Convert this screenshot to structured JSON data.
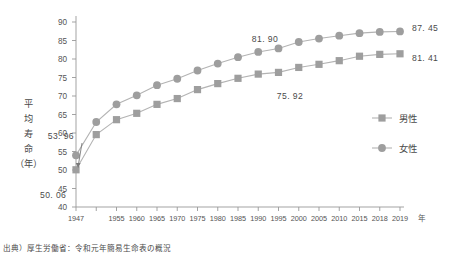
{
  "source_note": "出典）厚生労働省：令和元年簡易生命表の概況",
  "axis": {
    "y_title": "平均寿命（年）",
    "y_title_chars": [
      "平",
      "均",
      "寿",
      "命",
      "（年）"
    ],
    "x_unit": "年",
    "y_ticks": [
      40,
      45,
      50,
      55,
      60,
      65,
      70,
      75,
      80,
      85,
      90
    ],
    "x_tick_labels": [
      "1947",
      "",
      "1955",
      "1960",
      "1965",
      "1970",
      "1975",
      "1980",
      "1985",
      "1990",
      "1995",
      "2000",
      "2005",
      "2010",
      "2015",
      "2018",
      "2019"
    ]
  },
  "legend": {
    "items": [
      {
        "label": "男性",
        "marker": "square",
        "color": "#9e9e9e"
      },
      {
        "label": "女性",
        "marker": "circle",
        "color": "#9e9e9e"
      }
    ]
  },
  "annotations": [
    {
      "text": "53. 96",
      "series": "女性",
      "year": 1947
    },
    {
      "text": "50. 06",
      "series": "男性",
      "year": 1947
    },
    {
      "text": "81. 90",
      "series": "女性",
      "year": 1990
    },
    {
      "text": "75. 92",
      "series": "男性",
      "year": 1990
    },
    {
      "text": "87. 45",
      "series": "女性",
      "year": 2019
    },
    {
      "text": "81. 41",
      "series": "男性",
      "year": 2019
    }
  ],
  "chart_data": {
    "type": "line",
    "title": "",
    "xlabel": "年",
    "ylabel": "平均寿命（年）",
    "ylim": [
      40,
      90
    ],
    "xlim": [
      1947,
      2019
    ],
    "grid": false,
    "legend_position": "right",
    "x": [
      1947,
      1950,
      1955,
      1960,
      1965,
      1970,
      1975,
      1980,
      1985,
      1990,
      1995,
      2000,
      2005,
      2010,
      2015,
      2018,
      2019
    ],
    "series": [
      {
        "name": "男性",
        "marker": "square",
        "color": "#9e9e9e",
        "values": [
          50.06,
          59.57,
          63.6,
          65.32,
          67.74,
          69.31,
          71.73,
          73.35,
          74.78,
          75.92,
          76.38,
          77.72,
          78.56,
          79.55,
          80.75,
          81.25,
          81.41
        ]
      },
      {
        "name": "女性",
        "marker": "circle",
        "color": "#9e9e9e",
        "values": [
          53.96,
          62.97,
          67.75,
          70.19,
          72.92,
          74.66,
          76.89,
          78.76,
          80.48,
          81.9,
          82.85,
          84.6,
          85.52,
          86.3,
          86.99,
          87.32,
          87.45
        ]
      }
    ]
  }
}
